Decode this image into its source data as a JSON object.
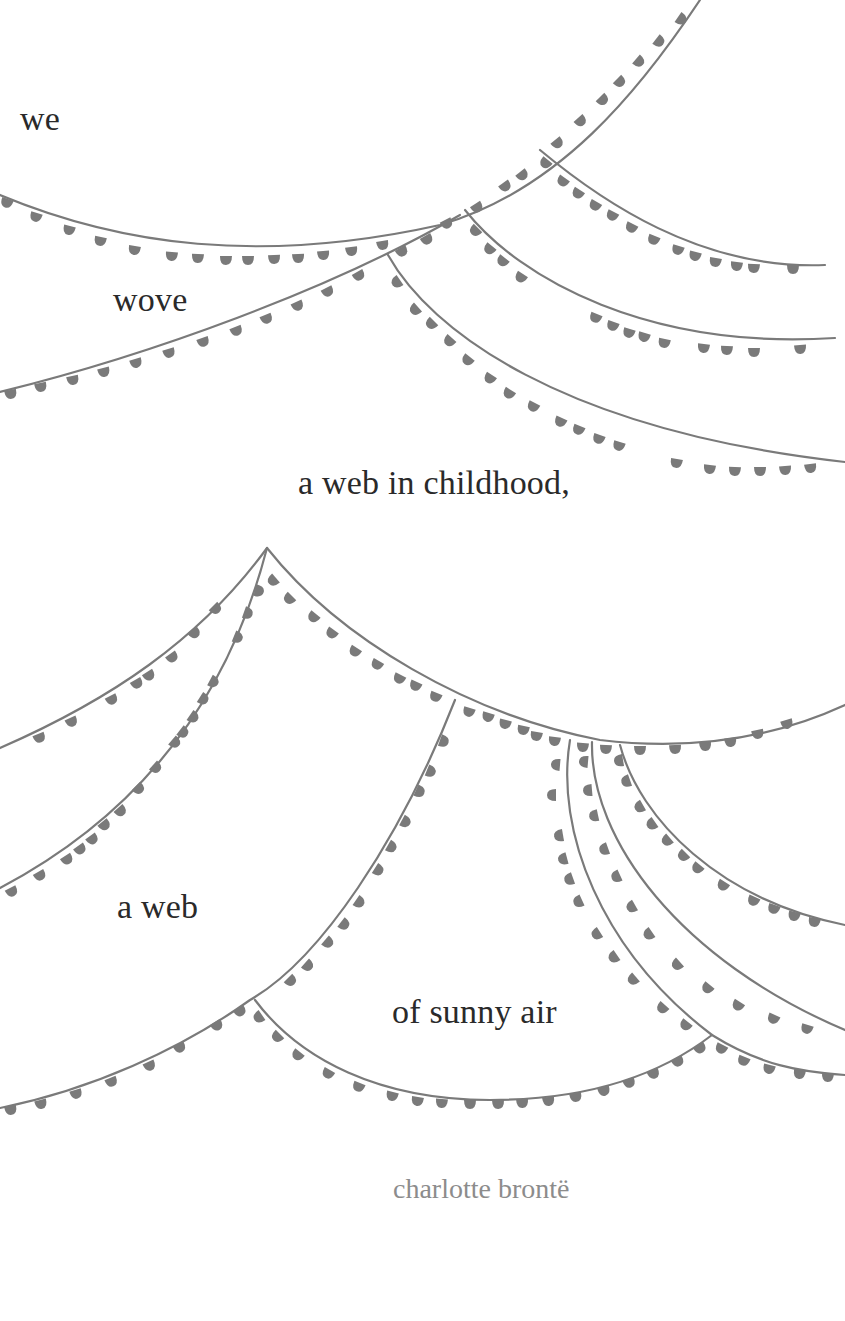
{
  "poem": {
    "lines": [
      {
        "text": "we",
        "x": 20,
        "y": 102
      },
      {
        "text": "wove",
        "x": 113,
        "y": 283
      },
      {
        "text": "a web in childhood,",
        "x": 298,
        "y": 466
      },
      {
        "text": "a web",
        "x": 117,
        "y": 890
      },
      {
        "text": "of sunny air",
        "x": 392,
        "y": 995
      }
    ],
    "attribution": "charlotte brontë"
  },
  "decoration": {
    "type": "bunting-garlands",
    "string_color": "#7a7a7a",
    "flag_color": "#7a7a7a",
    "background": "#ffffff"
  }
}
